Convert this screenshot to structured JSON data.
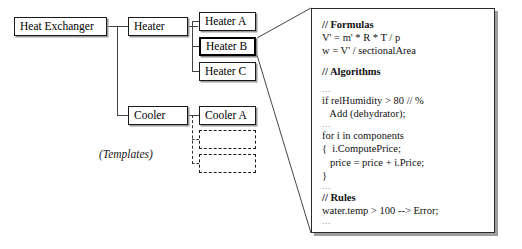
{
  "diagram": {
    "nodes": [
      {
        "id": "heat-exchanger",
        "label": "Heat Exchanger",
        "x": 14,
        "y": 17,
        "w": 93,
        "h": 19,
        "selected": false
      },
      {
        "id": "heater",
        "label": "Heater",
        "x": 128,
        "y": 17,
        "w": 60,
        "h": 19,
        "selected": false
      },
      {
        "id": "heater-a",
        "label": "Heater A",
        "x": 199,
        "y": 12,
        "w": 57,
        "h": 19,
        "selected": false
      },
      {
        "id": "heater-b",
        "label": "Heater B",
        "x": 199,
        "y": 37,
        "w": 57,
        "h": 19,
        "selected": true
      },
      {
        "id": "heater-c",
        "label": "Heater C",
        "x": 199,
        "y": 62,
        "w": 57,
        "h": 19,
        "selected": false
      },
      {
        "id": "cooler",
        "label": "Cooler",
        "x": 128,
        "y": 106,
        "w": 60,
        "h": 19,
        "selected": false
      },
      {
        "id": "cooler-a",
        "label": "Cooler A",
        "x": 199,
        "y": 106,
        "w": 57,
        "h": 19,
        "selected": false
      }
    ],
    "templates": {
      "label": "(Templates)",
      "label_x": 99,
      "label_y": 148,
      "boxes": [
        {
          "x": 199,
          "y": 130,
          "w": 57,
          "h": 19
        },
        {
          "x": 199,
          "y": 154,
          "w": 57,
          "h": 19
        }
      ]
    }
  },
  "code_panel": {
    "lines": [
      {
        "text": "// Formulas",
        "style": "bold"
      },
      {
        "text": "V' = m' * R * T / p",
        "style": "normal"
      },
      {
        "text": "w = V' / sectionalArea",
        "style": "normal"
      },
      {
        "text": "",
        "style": "gap"
      },
      {
        "text": "// Algorithms",
        "style": "bold"
      },
      {
        "text": "",
        "style": "gap"
      },
      {
        "text": "...",
        "style": "ellipsis"
      },
      {
        "text": "if relHumidity > 80 // %",
        "style": "normal"
      },
      {
        "text": "   Add (dehydrator);",
        "style": "normal"
      },
      {
        "text": "...",
        "style": "ellipsis"
      },
      {
        "text": "for i in components",
        "style": "normal"
      },
      {
        "text": "{  i.ComputePrice;",
        "style": "normal"
      },
      {
        "text": "   price = price + i.Price;",
        "style": "normal"
      },
      {
        "text": "}",
        "style": "normal"
      },
      {
        "text": "...",
        "style": "ellipsis"
      },
      {
        "text": "// Rules",
        "style": "bold"
      },
      {
        "text": "water.temp > 100 --> Error;",
        "style": "normal"
      },
      {
        "text": "...",
        "style": "ellipsis"
      }
    ]
  },
  "colors": {
    "line": "#444444",
    "border": "#1a1a1a",
    "shadow": "#9a9a9a",
    "background": "#ffffff",
    "text": "#000000"
  }
}
